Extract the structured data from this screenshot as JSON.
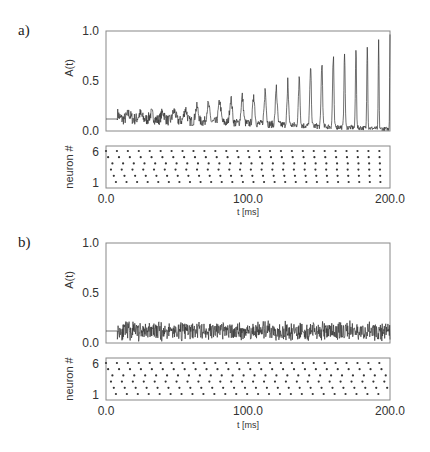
{
  "figure": {
    "panels": [
      {
        "label": "a)",
        "ylabel": "A(t)",
        "raster_ylabel": "neuron #",
        "xlabel": "t [ms]"
      },
      {
        "label": "b)",
        "ylabel": "A(t)",
        "raster_ylabel": "neuron #",
        "xlabel": "t [ms]"
      }
    ]
  },
  "chart_data": [
    {
      "panel": "a",
      "type": "line",
      "title": "",
      "xlabel": "",
      "ylabel": "A(t)",
      "xlim": [
        0,
        200
      ],
      "ylim": [
        0,
        1
      ],
      "yticks": [
        "0.0",
        "0.5",
        "1.0"
      ],
      "grid": false,
      "description": "Population activity; baseline 0.12 until ~8 ms, then noisy activity developing growing periodic peaks (period ~8 ms)",
      "baseline": 0.12,
      "onset_ms": 8,
      "peaks": {
        "t": [
          100,
          108,
          116,
          124,
          132,
          140,
          148,
          156,
          164,
          172,
          180,
          188,
          196
        ],
        "A": [
          0.3,
          0.32,
          0.43,
          0.36,
          0.43,
          0.57,
          0.7,
          0.74,
          0.86,
          0.8,
          0.96,
          1.0,
          1.0
        ]
      },
      "trough_level_late": 0.02
    },
    {
      "panel": "a",
      "type": "scatter",
      "subtype": "raster",
      "xlabel": "t [ms]",
      "ylabel": "neuron #",
      "xlim": [
        0,
        200
      ],
      "ylim": [
        1,
        6
      ],
      "xticks": [
        "0.0",
        "100.0",
        "200.0"
      ],
      "yticks": [
        "1",
        "6"
      ],
      "period_ms": 7.7,
      "neurons": [
        1,
        2,
        3,
        4,
        5,
        6
      ],
      "initial_phase_ms": [
        7.0,
        5.5,
        3.5,
        4.5,
        1.5,
        0.0
      ],
      "final_phase_ms": [
        0.5,
        0.4,
        0.3,
        0.2,
        0.1,
        0.0
      ],
      "description": "Spike raster of 6 neurons; phases converge to synchrony"
    },
    {
      "panel": "b",
      "type": "line",
      "xlabel": "",
      "ylabel": "A(t)",
      "xlim": [
        0,
        200
      ],
      "ylim": [
        0,
        1
      ],
      "yticks": [
        "0.0",
        "0.5",
        "1.0"
      ],
      "grid": false,
      "description": "Population activity; baseline 0.12, then stationary noisy activity fluctuating ~0.05–0.22",
      "baseline": 0.12,
      "onset_ms": 8,
      "mean": 0.12,
      "range": [
        0.04,
        0.22
      ]
    },
    {
      "panel": "b",
      "type": "scatter",
      "subtype": "raster",
      "xlabel": "t [ms]",
      "ylabel": "neuron #",
      "xlim": [
        0,
        200
      ],
      "ylim": [
        1,
        6
      ],
      "xticks": [
        "0.0",
        "100.0",
        "200.0"
      ],
      "yticks": [
        "1",
        "6"
      ],
      "period_ms": 7.7,
      "neurons": [
        1,
        2,
        3,
        4,
        5,
        6
      ],
      "initial_phase_ms": [
        7.0,
        5.5,
        3.5,
        4.5,
        1.5,
        0.0
      ],
      "final_phase_ms": [
        7.0,
        5.5,
        3.5,
        4.5,
        1.5,
        0.0
      ],
      "description": "Spike raster of 6 neurons; phases remain asynchronous"
    }
  ]
}
